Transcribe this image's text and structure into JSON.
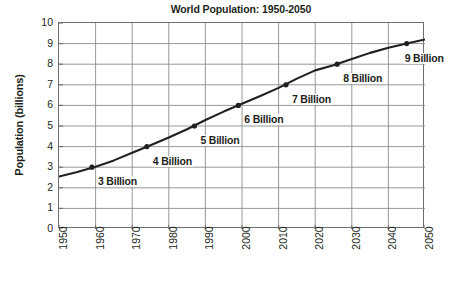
{
  "chart_data": {
    "type": "line",
    "title": "World Population: 1950-2050",
    "xlabel": "",
    "ylabel": "Population (billions)",
    "xlim": [
      1950,
      2050
    ],
    "ylim": [
      0,
      10
    ],
    "grid": true,
    "legend": "none",
    "x_ticks": [
      "1950",
      "1960",
      "1970",
      "1980",
      "1990",
      "2000",
      "2010",
      "2020",
      "2030",
      "2040",
      "2050"
    ],
    "y_ticks": [
      "0",
      "1",
      "2",
      "3",
      "4",
      "5",
      "6",
      "7",
      "8",
      "9",
      "10"
    ],
    "series": [
      {
        "name": "World Population",
        "color": "#231f20",
        "x": [
          1950,
          1955,
          1960,
          1965,
          1970,
          1975,
          1980,
          1985,
          1990,
          1995,
          2000,
          2005,
          2010,
          2015,
          2020,
          2025,
          2030,
          2035,
          2040,
          2045,
          2050
        ],
        "values": [
          2.55,
          2.77,
          3.02,
          3.33,
          3.7,
          4.07,
          4.44,
          4.84,
          5.29,
          5.7,
          6.08,
          6.46,
          6.85,
          7.3,
          7.7,
          7.95,
          8.25,
          8.55,
          8.8,
          9.0,
          9.2
        ]
      }
    ],
    "annotations": [
      {
        "label": "3 Billion",
        "x": 1959,
        "y": 3
      },
      {
        "label": "4 Billion",
        "x": 1974,
        "y": 4
      },
      {
        "label": "5 Billion",
        "x": 1987,
        "y": 5
      },
      {
        "label": "6 Billion",
        "x": 1999,
        "y": 6
      },
      {
        "label": "7 Billion",
        "x": 2012,
        "y": 7
      },
      {
        "label": "8 Billion",
        "x": 2026,
        "y": 8
      },
      {
        "label": "9 Billion",
        "x": 2045,
        "y": 9
      }
    ],
    "markers": [
      {
        "x": 1959,
        "y": 3
      },
      {
        "x": 1974,
        "y": 4
      },
      {
        "x": 1987,
        "y": 5
      },
      {
        "x": 1999,
        "y": 6
      },
      {
        "x": 2012,
        "y": 7
      },
      {
        "x": 2026,
        "y": 8
      },
      {
        "x": 2045,
        "y": 9
      }
    ],
    "colors": {
      "line": "#231f20",
      "marker": "#231f20",
      "grid": "#8c8c8e",
      "axis": "#6d6e71",
      "text": "#231f20",
      "background": "#ffffff"
    },
    "annotation_offsets": [
      {
        "dx": 6,
        "dy": 10
      },
      {
        "dx": 6,
        "dy": 10
      },
      {
        "dx": 6,
        "dy": 10
      },
      {
        "dx": 6,
        "dy": 10
      },
      {
        "dx": 6,
        "dy": 10
      },
      {
        "dx": 6,
        "dy": 10
      },
      {
        "dx": -2,
        "dy": 10
      }
    ]
  }
}
